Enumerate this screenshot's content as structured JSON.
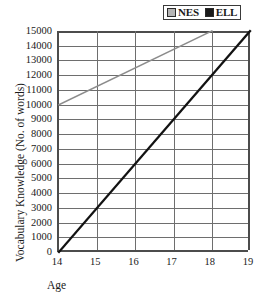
{
  "chart_data": {
    "type": "line",
    "title": "",
    "xlabel": "Age",
    "ylabel": "Vocabulary Knowledge (No. of words)",
    "xlim": [
      14,
      19
    ],
    "ylim": [
      0,
      15000
    ],
    "xticks": [
      "14",
      "15",
      "16",
      "17",
      "18",
      "19"
    ],
    "yticks": [
      "15000",
      "14000",
      "13000",
      "12000",
      "11000",
      "10000",
      "9000",
      "8000",
      "7000",
      "6000",
      "5000",
      "4000",
      "3000",
      "2000",
      "1000",
      "0"
    ],
    "grid": "both",
    "legend_position": "top-right",
    "series": [
      {
        "name": "NES",
        "color": "#8c8c8c",
        "x": [
          14,
          18
        ],
        "values": [
          10000,
          15000
        ],
        "stroke_width": 1.6
      },
      {
        "name": "ELL",
        "color": "#121212",
        "x": [
          14,
          19
        ],
        "values": [
          0,
          15000
        ],
        "stroke_width": 2.3
      }
    ]
  },
  "legend": {
    "entries": [
      {
        "label": "NES",
        "swatch_color": "#b5b5b5"
      },
      {
        "label": "ELL",
        "swatch_color": "#1a1a1a"
      }
    ]
  },
  "axes": {
    "x_title": "Age",
    "y_title": "Vocabulary Knowledge (No. of words)"
  },
  "colors": {
    "axis": "#4c4c4c",
    "grid": "#6e6e6e",
    "nes_line": "#8c8c8c",
    "ell_line": "#121212",
    "background": "#ffffff",
    "text": "#1a1a1a"
  }
}
